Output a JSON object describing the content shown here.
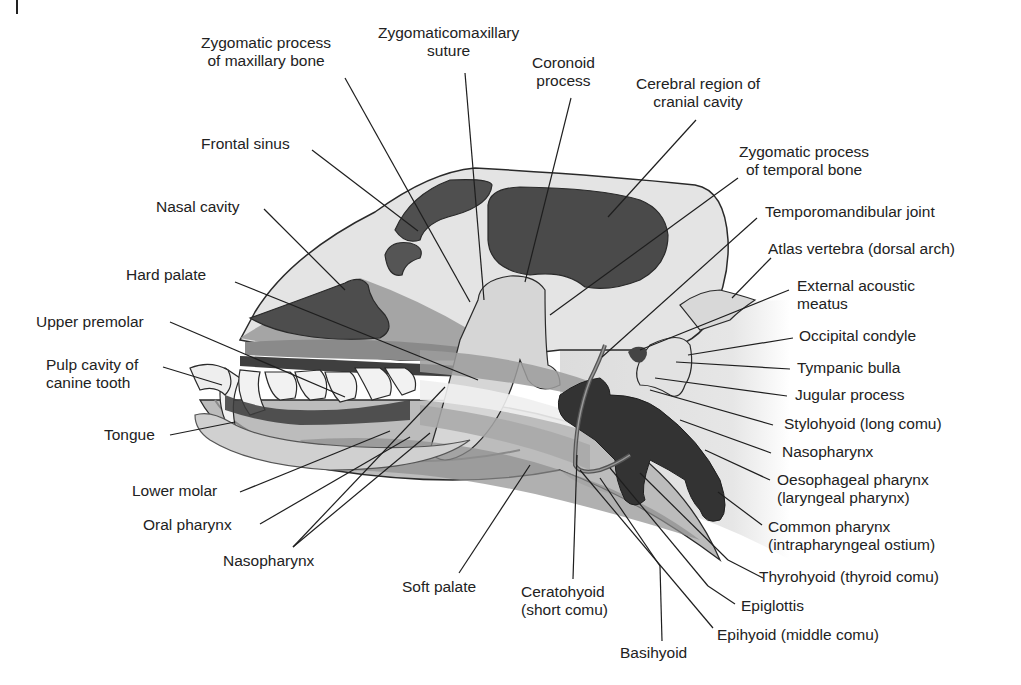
{
  "figure": {
    "colors": {
      "background": "#ffffff",
      "outline": "#2a2a2a",
      "dark_cavity": "#4a4a4a",
      "mid_tone": "#8c8c8c",
      "light_tone": "#cfcfcf",
      "pale_tone": "#e6e6e6"
    }
  },
  "labels": {
    "zygomatic_maxillary": [
      "Zygomatic process",
      "of maxillary bone"
    ],
    "zygomaticomaxillary_suture": [
      "Zygomaticomaxillary",
      "suture"
    ],
    "coronoid_process": [
      "Coronoid",
      "process"
    ],
    "cerebral_region": [
      "Cerebral region of",
      "cranial cavity"
    ],
    "zygomatic_temporal": [
      "Zygomatic process",
      "of temporal bone"
    ],
    "frontal_sinus": "Frontal sinus",
    "nasal_cavity": "Nasal cavity",
    "hard_palate": "Hard palate",
    "upper_premolar": "Upper premolar",
    "pulp_cavity": [
      "Pulp cavity of",
      "canine tooth"
    ],
    "tongue": "Tongue",
    "lower_molar": "Lower molar",
    "oral_pharynx": "Oral pharynx",
    "nasopharynx_left": "Nasopharynx",
    "soft_palate": "Soft palate",
    "ceratohyoid": [
      "Ceratohyoid",
      "(short comu)"
    ],
    "basihyoid": "Basihyoid",
    "epihyoid": "Epihyoid (middle comu)",
    "epiglottis": "Epiglottis",
    "thyrohyoid": "Thyrohyoid (thyroid comu)",
    "common_pharynx": [
      "Common pharynx",
      "(intrapharyngeal ostium)"
    ],
    "oesophageal_pharynx": [
      "Oesophageal pharynx",
      "(laryngeal pharynx)"
    ],
    "nasopharynx_right": "Nasopharynx",
    "stylohyoid": "Stylohyoid (long comu)",
    "jugular_process": "Jugular process",
    "tympanic_bulla": "Tympanic bulla",
    "occipital_condyle": "Occipital condyle",
    "external_acoustic_meatus": [
      "External acoustic",
      "meatus"
    ],
    "atlas_vertebra": "Atlas vertebra (dorsal arch)",
    "temporomandibular_joint": "Temporomandibular joint"
  }
}
